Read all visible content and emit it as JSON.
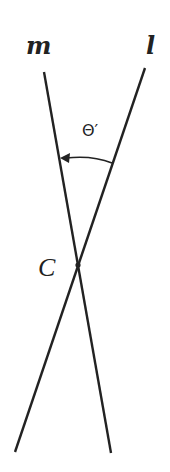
{
  "diagram": {
    "labels": {
      "line_m": "m",
      "line_l": "l",
      "angle": "Θ′",
      "intersection": "C"
    },
    "lines": {
      "m": {
        "x1": 44,
        "y1": 72,
        "x2": 111,
        "y2": 453
      },
      "l": {
        "x1": 145,
        "y1": 68,
        "x2": 15,
        "y2": 452
      }
    },
    "intersection_point": {
      "x": 78,
      "y": 265
    },
    "angle_arc": {
      "from": "l",
      "to": "m",
      "direction": "counterclockwise",
      "arrow_at": "m"
    },
    "colors": {
      "stroke": "#222222",
      "background": "#ffffff"
    }
  }
}
